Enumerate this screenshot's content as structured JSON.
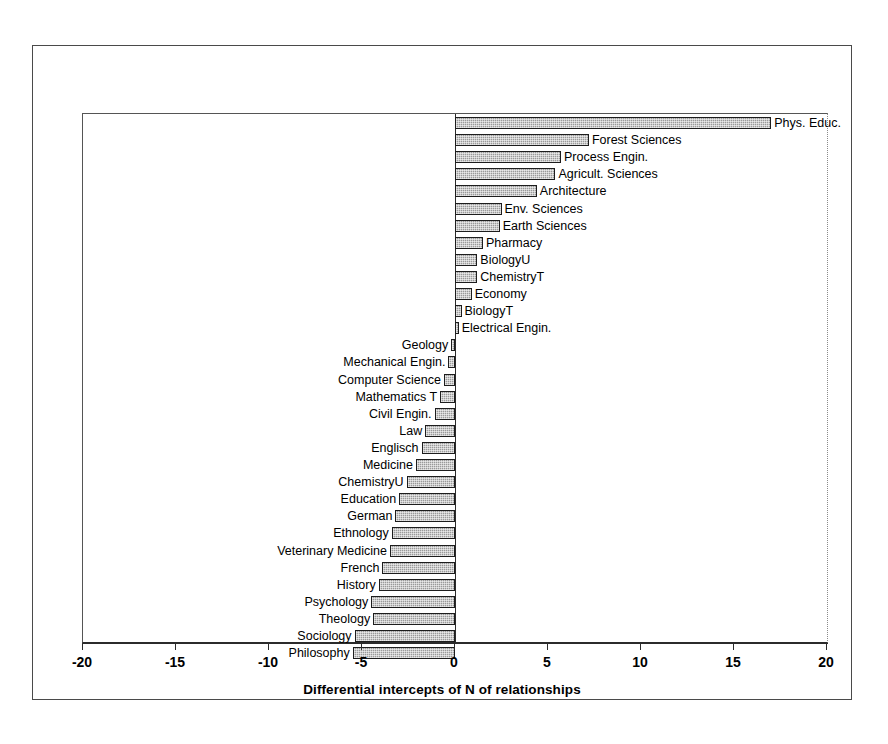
{
  "chart_data": {
    "type": "bar",
    "orientation": "horizontal",
    "title": "",
    "xlabel": "Differential intercepts of N of relationships",
    "ylabel": "",
    "xlim": [
      -20,
      20
    ],
    "xticks": [
      -20,
      -15,
      -10,
      -5,
      0,
      5,
      10,
      15,
      20
    ],
    "xticklabels": [
      "-20",
      "-15",
      "-10",
      "-5",
      "0",
      "5",
      "10",
      "15",
      "20"
    ],
    "grid": false,
    "legend": null,
    "bar_fill_color": "#9a9a9a",
    "bar_edge_color": "#1d1d1d",
    "categories": [
      "Phys. Educ.",
      "Forest Sciences",
      "Process Engin.",
      "Agricult. Sciences",
      "Architecture",
      "Env. Sciences",
      "Earth Sciences",
      "Pharmacy",
      "BiologyU",
      "ChemistryT",
      "Economy",
      "BiologyT",
      "Electrical Engin.",
      "Geology",
      "Mechanical Engin.",
      "Computer Science",
      "Mathematics T",
      "Civil Engin.",
      "Law",
      "Englisch",
      "Medicine",
      "ChemistryU",
      "Education",
      "German",
      "Ethnology",
      "Veterinary Medicine",
      "French",
      "History",
      "Psychology",
      "Theology",
      "Sociology",
      "Philosophy"
    ],
    "values": [
      17.0,
      7.2,
      5.7,
      5.4,
      4.4,
      2.5,
      2.4,
      1.5,
      1.2,
      1.2,
      0.9,
      0.35,
      0.2,
      -0.2,
      -0.35,
      -0.6,
      -0.8,
      -1.1,
      -1.6,
      -1.8,
      -2.1,
      -2.6,
      -3.0,
      -3.2,
      -3.4,
      -3.5,
      -3.9,
      -4.1,
      -4.5,
      -4.4,
      -5.4,
      -5.5
    ]
  }
}
